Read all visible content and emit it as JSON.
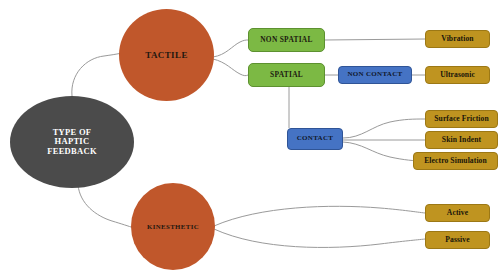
{
  "diagram": {
    "background_color": "#ffffff",
    "edge_color": "#9a9a9a",
    "root": {
      "id": "root",
      "label": "TYPE OF\nHAPTIC\nFEEDBACK",
      "line1": "TYPE OF",
      "line2": "HAPTIC",
      "line3": "FEEDBACK",
      "shape": "circle",
      "color": "#4b4b4b",
      "text_color": "#ffffff"
    },
    "branches": [
      {
        "id": "tactile",
        "label": "TACTILE",
        "shape": "circle",
        "color": "#c0572b",
        "children": [
          {
            "id": "non-spatial",
            "label": "NON SPATIAL",
            "shape": "box",
            "color": "#7cb944",
            "children": [
              {
                "id": "vibration",
                "label": "Vibration",
                "shape": "box",
                "color": "#bf9420"
              }
            ]
          },
          {
            "id": "spatial",
            "label": "SPATIAL",
            "shape": "box",
            "color": "#7cb944",
            "children": [
              {
                "id": "non-contact",
                "label": "NON CONTACT",
                "shape": "box",
                "color": "#4573c4",
                "children": [
                  {
                    "id": "ultrasonic",
                    "label": "Ultrasonic",
                    "shape": "box",
                    "color": "#bf9420"
                  }
                ]
              },
              {
                "id": "contact",
                "label": "CONTACT",
                "shape": "box",
                "color": "#4573c4",
                "children": [
                  {
                    "id": "surface-friction",
                    "label": "Surface Friction",
                    "shape": "box",
                    "color": "#bf9420"
                  },
                  {
                    "id": "skin-indent",
                    "label": "Skin Indent",
                    "shape": "box",
                    "color": "#bf9420"
                  },
                  {
                    "id": "electro-simulation",
                    "label": "Electro Simulation",
                    "shape": "box",
                    "color": "#bf9420"
                  }
                ]
              }
            ]
          }
        ]
      },
      {
        "id": "kinesthetic",
        "label": "KINESTHETIC",
        "shape": "circle",
        "color": "#c0572b",
        "children": [
          {
            "id": "active",
            "label": "Active",
            "shape": "box",
            "color": "#bf9420"
          },
          {
            "id": "passive",
            "label": "Passive",
            "shape": "box",
            "color": "#bf9420"
          }
        ]
      }
    ]
  }
}
